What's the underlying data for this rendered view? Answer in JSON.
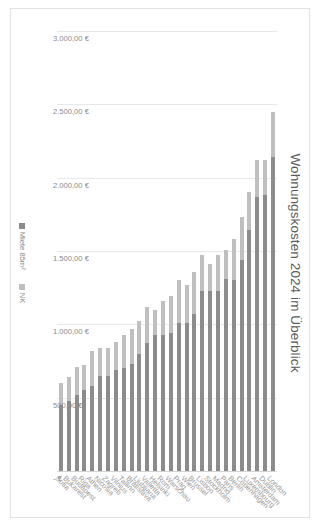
{
  "chart_data": {
    "type": "bar",
    "subtype": "stacked-horizontal-bar",
    "title": "Wohnungskosten 2024 im Überblick",
    "xlabel": "",
    "ylabel": "",
    "orientation": "horizontal",
    "grid": true,
    "legend_position": "bottom",
    "axis": {
      "min": 0,
      "max": 3000,
      "step": 500,
      "reversed": true,
      "tick_labels": [
        "3.000,00 €",
        "2.500,00 €",
        "2.000,00 €",
        "1.500,00 €",
        "1.000,00 €",
        "500,00 €",
        " - €"
      ],
      "tick_values": [
        3000,
        2500,
        2000,
        1500,
        1000,
        500,
        0
      ]
    },
    "categories": [
      "London",
      "Dublin",
      "Amsterdam",
      "Luxembourg",
      "Copenhagen",
      "Berlin",
      "Paris",
      "Madrid",
      "Stockholm",
      "Lisbon",
      "Brussel",
      "Wien",
      "Prag",
      "Warschau",
      "Rom",
      "Helsinki",
      "Valletta",
      "Ljubljana",
      "Bratislava",
      "Tallinn",
      "Vilnius",
      "Zagreb",
      "Nicosia",
      "Athen",
      "Riga",
      "Budapest",
      "Bukarest",
      "Sofia"
    ],
    "series": [
      {
        "name": "Miete 85m²",
        "color": "#8c8c8c",
        "values": [
          2140,
          1880,
          1870,
          1640,
          1440,
          1300,
          1310,
          1230,
          1230,
          1230,
          1070,
          1010,
          1010,
          940,
          930,
          930,
          870,
          800,
          730,
          700,
          690,
          650,
          650,
          580,
          550,
          520,
          480,
          450
        ]
      },
      {
        "name": "NK",
        "color": "#bfbfbf",
        "values": [
          310,
          240,
          250,
          260,
          290,
          280,
          200,
          240,
          180,
          240,
          290,
          260,
          290,
          250,
          230,
          170,
          250,
          220,
          240,
          230,
          190,
          190,
          190,
          240,
          170,
          190,
          160,
          150
        ]
      }
    ]
  },
  "legend": {
    "items": [
      {
        "label": "Miete 85m²"
      },
      {
        "label": "NK"
      }
    ]
  }
}
